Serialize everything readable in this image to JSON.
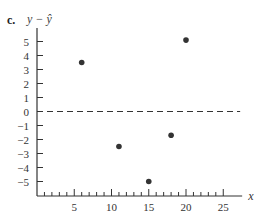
{
  "part_label": "c.",
  "chart_data": {
    "type": "scatter",
    "title": "",
    "xlabel": "x",
    "ylabel": "y − ŷ",
    "x": [
      6,
      11,
      15,
      18,
      20
    ],
    "y": [
      3.5,
      -2.5,
      -5.0,
      -1.7,
      5.1
    ],
    "xlim": [
      0,
      27
    ],
    "ylim": [
      -6,
      6
    ],
    "x_ticks": [
      5,
      10,
      15,
      20,
      25
    ],
    "y_ticks": [
      5,
      4,
      3,
      2,
      1,
      0,
      -1,
      -2,
      -3,
      -4,
      -5
    ],
    "x_minor_tick_step": 1,
    "reference_line": {
      "y": 0,
      "style": "dashed"
    },
    "grid": false,
    "legend": null,
    "colors": {
      "axis": "#333333",
      "points": "#333333"
    }
  }
}
